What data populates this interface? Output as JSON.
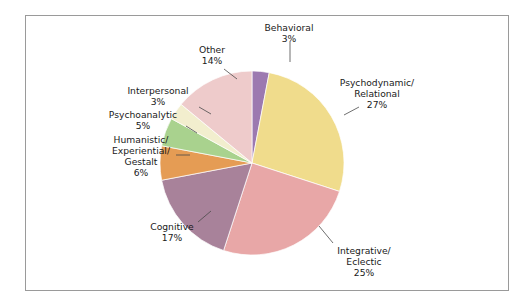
{
  "chart_data": {
    "type": "pie",
    "title": "",
    "subtitle": "",
    "xlabel": "",
    "ylabel": "",
    "legend_position": "none",
    "grid": false,
    "labels_show_percent": true,
    "categories": [
      "Behavioral",
      "Psychodynamic/\nRelational",
      "Integrative/\nEclectic",
      "Cognitive",
      "Humanistic/\nExperiential/\nGestalt",
      "Psychoanalytic",
      "Interpersonal",
      "Other"
    ],
    "values": [
      3,
      27,
      25,
      17,
      6,
      5,
      3,
      14
    ],
    "colors": [
      "#9c79b0",
      "#f0dc8c",
      "#e8a7a7",
      "#a8829a",
      "#e59c54",
      "#a9d28e",
      "#f2eece",
      "#eecbcb"
    ],
    "slices": [
      {
        "name": "Behavioral",
        "lines": [
          "Behavioral"
        ],
        "percent_text": "3%",
        "value": 3,
        "color": "#9c79b0",
        "label_x": 289,
        "label_y": 31,
        "anchor": "middle",
        "leader": [
          290,
          42,
          290,
          62
        ]
      },
      {
        "name": "Psychodynamic/Relational",
        "lines": [
          "Psychodynamic/",
          "Relational"
        ],
        "percent_text": "27%",
        "value": 27,
        "color": "#f0dc8c",
        "label_x": 377,
        "label_y": 86,
        "anchor": "middle",
        "leader": [
          344,
          115,
          359,
          107
        ]
      },
      {
        "name": "Integrative/Eclectic",
        "lines": [
          "Integrative/",
          "Eclectic"
        ],
        "percent_text": "25%",
        "value": 25,
        "color": "#e8a7a7",
        "label_x": 364,
        "label_y": 254,
        "anchor": "middle",
        "leader": [
          319,
          226,
          333,
          243
        ]
      },
      {
        "name": "Cognitive",
        "lines": [
          "Cognitive"
        ],
        "percent_text": "17%",
        "value": 17,
        "color": "#a8829a",
        "label_x": 172,
        "label_y": 230,
        "anchor": "middle",
        "leader": [
          198,
          222,
          211,
          211
        ]
      },
      {
        "name": "Humanistic/Experiential/Gestalt",
        "lines": [
          "Humanistic/",
          "Experiential/",
          "Gestalt"
        ],
        "percent_text": "6%",
        "value": 6,
        "color": "#e59c54",
        "label_x": 141,
        "label_y": 143,
        "anchor": "middle",
        "leader": [
          176,
          155,
          190,
          155
        ]
      },
      {
        "name": "Psychoanalytic",
        "lines": [
          "Psychoanalytic"
        ],
        "percent_text": "5%",
        "value": 5,
        "color": "#a9d28e",
        "label_x": 143,
        "label_y": 118,
        "anchor": "middle",
        "leader": [
          186,
          126,
          197,
          133
        ]
      },
      {
        "name": "Interpersonal",
        "lines": [
          "Interpersonal"
        ],
        "percent_text": "3%",
        "value": 3,
        "color": "#f2eece",
        "label_x": 158,
        "label_y": 94,
        "anchor": "middle",
        "leader": [
          199,
          107,
          211,
          114
        ]
      },
      {
        "name": "Other",
        "lines": [
          "Other"
        ],
        "percent_text": "14%",
        "value": 14,
        "color": "#eecbcb",
        "label_x": 212,
        "label_y": 53,
        "anchor": "middle",
        "leader": [
          224,
          69,
          237,
          79
        ]
      }
    ],
    "geometry": {
      "center_x": 252,
      "center_y": 163,
      "radius": 92,
      "start_angle_deg": -90
    },
    "frame_color": "#9a9a9a",
    "background": "#ffffff"
  }
}
